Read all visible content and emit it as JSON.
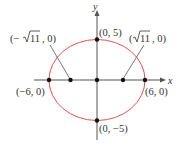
{
  "diagram": {
    "type": "ellipse",
    "axes": {
      "x_label": "x",
      "y_label": "y"
    },
    "colors": {
      "curve": "#e05050",
      "axis": "#555555",
      "point": "#111111",
      "text": "#333333"
    },
    "points": {
      "left_vertex": "(−6, 0)",
      "right_vertex": "(6, 0)",
      "top_covertex": "(0, 5)",
      "bottom_covertex": "(0, −5)",
      "left_focus_prefix": "(−",
      "left_focus_radicand": "11",
      "left_focus_suffix": ", 0)",
      "right_focus_prefix": "(",
      "right_focus_radicand": "11",
      "right_focus_suffix": ", 0)"
    }
  }
}
